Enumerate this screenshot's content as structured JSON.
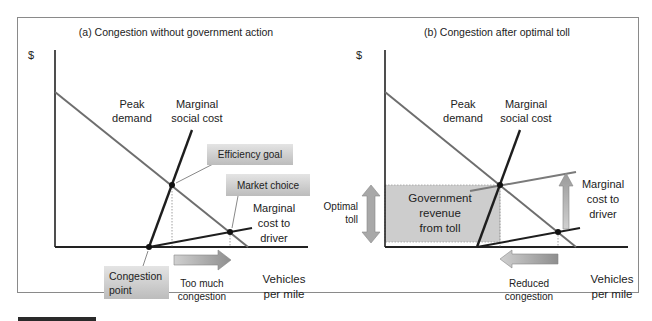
{
  "panels": [
    {
      "title": "(a) Congestion without government action",
      "y_axis_label": "$",
      "x_axis_label_line1": "Vehicles",
      "x_axis_label_line2": "per mile",
      "curve_labels": {
        "demand_line1": "Peak",
        "demand_line2": "demand",
        "msc_line1": "Marginal",
        "msc_line2": "social cost",
        "mcd_line1": "Marginal",
        "mcd_line2": "cost to",
        "mcd_line3": "driver"
      },
      "callouts": {
        "efficiency_goal": "Efficiency goal",
        "market_choice": "Market choice",
        "congestion_point_line1": "Congestion",
        "congestion_point_line2": "point"
      },
      "arrow_label_line1": "Too much",
      "arrow_label_line2": "congestion"
    },
    {
      "title": "(b) Congestion after optimal toll",
      "y_axis_label": "$",
      "x_axis_label_line1": "Vehicles",
      "x_axis_label_line2": "per mile",
      "curve_labels": {
        "demand_line1": "Peak",
        "demand_line2": "demand",
        "msc_line1": "Marginal",
        "msc_line2": "social cost",
        "mcd_line1": "Marginal",
        "mcd_line2": "cost to",
        "mcd_line3": "driver"
      },
      "toll_label_line1": "Optimal",
      "toll_label_line2": "toll",
      "revenue_line1": "Government",
      "revenue_line2": "revenue",
      "revenue_line3": "from toll",
      "arrow_label_line1": "Reduced",
      "arrow_label_line2": "congestion"
    }
  ],
  "colors": {
    "demand": "#6e6e6e",
    "cost_curves": "#1e1e1e",
    "shifted_curve": "#7a7a7a",
    "callout_fill": "#c8c8c8",
    "revenue_fill": "#cdcdcd",
    "arrow_fill": "#a8a8a8"
  }
}
